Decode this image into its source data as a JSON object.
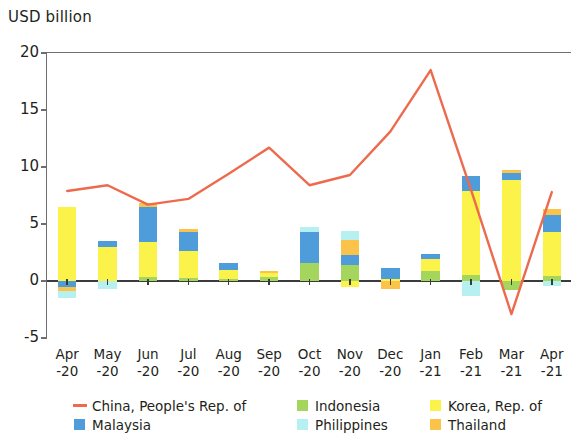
{
  "chart_data": {
    "type": "bar",
    "subtype": "stacked-bar-with-line-overlay",
    "title": "",
    "ylabel": "USD billion",
    "xlabel": "",
    "ylim": [
      -5,
      20
    ],
    "yticks": [
      -5,
      0,
      5,
      10,
      15,
      20
    ],
    "ytick_labels": [
      "-5",
      "0",
      "5",
      "10",
      "15",
      "20"
    ],
    "grid": false,
    "legend_position": "bottom",
    "categories": [
      "Apr\n-20",
      "May\n-20",
      "Jun\n-20",
      "Jul\n-20",
      "Aug\n-20",
      "Sep\n-20",
      "Oct\n-20",
      "Nov\n-20",
      "Dec\n-20",
      "Jan\n-21",
      "Feb\n-21",
      "Mar\n-21",
      "Apr\n-21"
    ],
    "category_labels": [
      {
        "month": "Apr",
        "year": "-20"
      },
      {
        "month": "May",
        "year": "-20"
      },
      {
        "month": "Jun",
        "year": "-20"
      },
      {
        "month": "Jul",
        "year": "-20"
      },
      {
        "month": "Aug",
        "year": "-20"
      },
      {
        "month": "Sep",
        "year": "-20"
      },
      {
        "month": "Oct",
        "year": "-20"
      },
      {
        "month": "Nov",
        "year": "-20"
      },
      {
        "month": "Dec",
        "year": "-20"
      },
      {
        "month": "Jan",
        "year": "-21"
      },
      {
        "month": "Feb",
        "year": "-21"
      },
      {
        "month": "Mar",
        "year": "-21"
      },
      {
        "month": "Apr",
        "year": "-21"
      }
    ],
    "series": [
      {
        "name": "Indonesia",
        "kind": "bar",
        "color": "#a4d65e",
        "values": [
          0.0,
          0.0,
          0.35,
          0.25,
          0.2,
          0.35,
          1.6,
          1.4,
          0.0,
          0.9,
          0.5,
          -0.8,
          0.4
        ]
      },
      {
        "name": "Korea, Rep. of",
        "kind": "bar",
        "color": "#fbf24a",
        "values": [
          6.5,
          3.0,
          3.05,
          2.35,
          0.8,
          0.35,
          0.0,
          -0.5,
          0.15,
          1.0,
          7.4,
          8.9,
          3.9
        ]
      },
      {
        "name": "Malaysia",
        "kind": "bar",
        "color": "#4e9cd9",
        "values": [
          -0.55,
          0.5,
          3.1,
          1.7,
          0.6,
          0.0,
          2.7,
          0.9,
          0.95,
          0.5,
          1.3,
          0.55,
          1.5
        ]
      },
      {
        "name": "Thailand",
        "kind": "bar",
        "color": "#fbc34a",
        "values": [
          -0.35,
          0.0,
          0.35,
          0.25,
          0.0,
          0.2,
          0.0,
          1.3,
          -0.7,
          0.0,
          0.0,
          0.25,
          0.5
        ]
      },
      {
        "name": "Philippines",
        "kind": "bar",
        "color": "#b6f0f0",
        "values": [
          -0.55,
          -0.7,
          0.0,
          0.0,
          0.0,
          0.0,
          0.45,
          0.8,
          0.0,
          0.0,
          -1.3,
          0.0,
          -0.45
        ]
      },
      {
        "name": "China, People's Rep. of",
        "kind": "line",
        "color": "#ee6a4d",
        "values": [
          7.9,
          8.4,
          6.7,
          7.2,
          9.4,
          11.7,
          8.4,
          9.3,
          13.1,
          18.5,
          8.0,
          -2.9,
          7.8
        ]
      }
    ]
  },
  "legend": {
    "column1": [
      {
        "label": "China, People's Rep. of",
        "marker": "line",
        "color": "#ee6a4d"
      },
      {
        "label": "Malaysia",
        "marker": "square",
        "color": "#4e9cd9"
      }
    ],
    "column2": [
      {
        "label": "Indonesia",
        "marker": "square",
        "color": "#a4d65e"
      },
      {
        "label": "Philippines",
        "marker": "square",
        "color": "#b6f0f0"
      }
    ],
    "column3": [
      {
        "label": "Korea, Rep. of",
        "marker": "square",
        "color": "#fbf24a"
      },
      {
        "label": "Thailand",
        "marker": "square",
        "color": "#fbc34a"
      }
    ]
  },
  "axes": {
    "y_title": "USD billion"
  }
}
